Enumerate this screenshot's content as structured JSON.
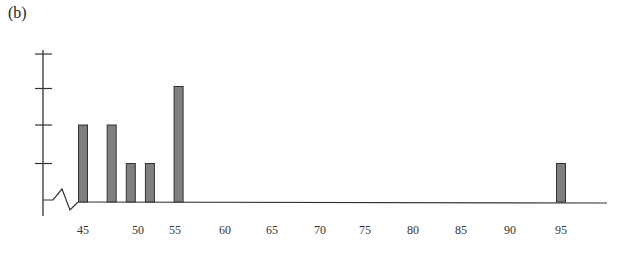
{
  "panel_label": "(b)",
  "colors": {
    "bar_fill": "#7f7f7f",
    "bar_stroke": "#333333",
    "axis": "#333333"
  },
  "chart_data": {
    "type": "bar",
    "title": "",
    "panel": "(b)",
    "xlabel": "",
    "ylabel": "",
    "x_tick_labels": [
      "45",
      "50",
      "55",
      "60",
      "65",
      "70",
      "75",
      "80",
      "85",
      "90",
      "95"
    ],
    "categories": [
      "45",
      "48",
      "50",
      "52",
      "55",
      "95"
    ],
    "values": [
      2,
      2,
      1,
      1,
      3,
      1
    ],
    "ylim": [
      0,
      4
    ],
    "y_ticks": [
      1,
      2,
      3,
      4
    ],
    "y_tick_labels_shown": false,
    "axis_break": true,
    "grid": false,
    "legend": null
  }
}
